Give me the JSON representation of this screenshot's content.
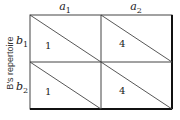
{
  "columns": [
    {
      "var": "a",
      "sub": "1"
    },
    {
      "var": "a",
      "sub": "2"
    }
  ],
  "rows": [
    {
      "var": "b",
      "sub": "1"
    },
    {
      "var": "b",
      "sub": "2"
    }
  ],
  "row_axis_title": "B's repertoire",
  "cells": [
    [
      "1",
      "4"
    ],
    [
      "1",
      "4"
    ]
  ],
  "colors": {
    "line": "#333333",
    "border_heavy": "#111111"
  }
}
